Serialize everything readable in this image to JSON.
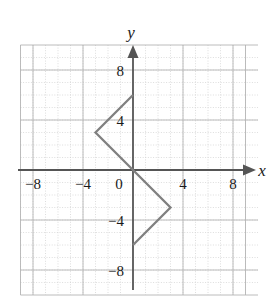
{
  "chart_data": {
    "type": "line",
    "title": "",
    "xlabel": "x",
    "ylabel": "y",
    "xlim": [
      -10,
      10
    ],
    "ylim": [
      -10,
      10
    ],
    "grid": true,
    "grid_step": 1,
    "legend": "none",
    "x_ticks": [
      -8,
      -4,
      0,
      4,
      8
    ],
    "y_ticks": [
      8,
      4,
      -4,
      -8
    ],
    "x_tick_labels": [
      "−8",
      "−4",
      "0",
      "4",
      "8"
    ],
    "y_tick_labels": [
      "8",
      "4",
      "−4",
      "−8"
    ],
    "series": [
      {
        "name": "zigzag-path",
        "color": "#808080",
        "x": [
          0,
          -3,
          0,
          3,
          0
        ],
        "y": [
          6,
          3,
          0,
          -3,
          -6
        ],
        "points": "0,6 -3,3 0,0 3,-3 0,-6"
      }
    ],
    "annotations": []
  },
  "axes": {
    "x_letter": "x",
    "y_letter": "y",
    "x_arrow": "right-arrow",
    "y_arrow": "up-arrow",
    "axis_color": "#555555"
  },
  "style": {
    "grid_color": "#c8c8c8",
    "background": "#ffffff",
    "curve_color": "#808080",
    "text_color": "#1a1a1a"
  }
}
